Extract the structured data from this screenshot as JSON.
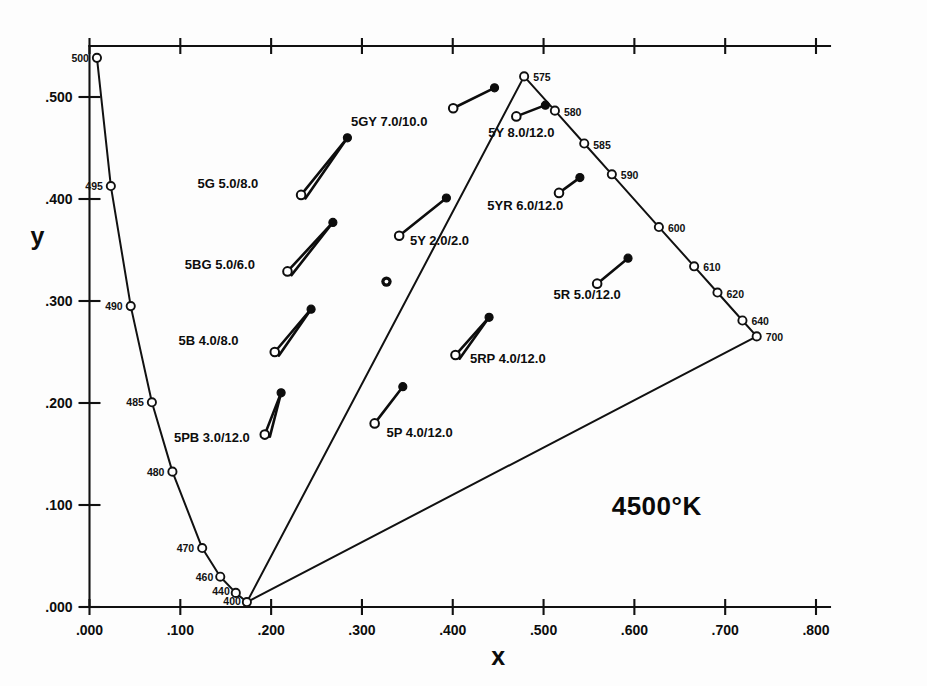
{
  "chart_data": {
    "type": "scatter",
    "title": "",
    "annotation": "4500°K",
    "xlabel": "x",
    "ylabel": "y",
    "xlim": [
      0.0,
      0.8
    ],
    "ylim": [
      0.0,
      0.55
    ],
    "grid": false,
    "legend": "none",
    "xticks": [
      ".000",
      ".100",
      ".200",
      ".300",
      ".400",
      ".500",
      ".600",
      ".700",
      ".800"
    ],
    "xtick_values": [
      0.0,
      0.1,
      0.2,
      0.3,
      0.4,
      0.5,
      0.6,
      0.7,
      0.8
    ],
    "yticks": [
      ".000",
      ".100",
      ".200",
      ".300",
      ".400",
      ".500"
    ],
    "ytick_values": [
      0.0,
      0.1,
      0.2,
      0.3,
      0.4,
      0.5
    ],
    "spectral_locus": {
      "name": "CIE spectral locus",
      "points": [
        {
          "label": "500",
          "x": 0.0082,
          "y": 0.5384
        },
        {
          "label": "495",
          "x": 0.0235,
          "y": 0.4127
        },
        {
          "label": "490",
          "x": 0.0454,
          "y": 0.295
        },
        {
          "label": "485",
          "x": 0.0687,
          "y": 0.2007
        },
        {
          "label": "480",
          "x": 0.0913,
          "y": 0.1327
        },
        {
          "label": "470",
          "x": 0.1241,
          "y": 0.0578
        },
        {
          "label": "460",
          "x": 0.144,
          "y": 0.0297
        },
        {
          "label": "440",
          "x": 0.1611,
          "y": 0.0138
        },
        {
          "label": "400",
          "x": 0.1733,
          "y": 0.0048
        },
        {
          "label": "575",
          "x": 0.4786,
          "y": 0.5202
        },
        {
          "label": "580",
          "x": 0.5125,
          "y": 0.4866
        },
        {
          "label": "585",
          "x": 0.5448,
          "y": 0.4544
        },
        {
          "label": "590",
          "x": 0.5752,
          "y": 0.4242
        },
        {
          "label": "600",
          "x": 0.627,
          "y": 0.3725
        },
        {
          "label": "610",
          "x": 0.6658,
          "y": 0.334
        },
        {
          "label": "620",
          "x": 0.6915,
          "y": 0.3083
        },
        {
          "label": "640",
          "x": 0.719,
          "y": 0.2809
        },
        {
          "label": "700",
          "x": 0.7347,
          "y": 0.2653
        }
      ]
    },
    "white_point": {
      "name": "white-point",
      "x": 0.327,
      "y": 0.319
    },
    "munsell_samples": [
      {
        "label": "5GY 7.0/10.0",
        "start": {
          "x": 0.4005,
          "y": 0.489
        },
        "end": {
          "x": 0.446,
          "y": 0.509
        },
        "double_line": false,
        "label_x": 0.288,
        "label_y": 0.472
      },
      {
        "label": "5Y 8.0/12.0",
        "start": {
          "x": 0.47,
          "y": 0.481
        },
        "end": {
          "x": 0.502,
          "y": 0.492
        },
        "double_line": false,
        "label_x": 0.439,
        "label_y": 0.461
      },
      {
        "label": "5G 5.0/8.0",
        "start": {
          "x": 0.233,
          "y": 0.404
        },
        "end": {
          "x": 0.284,
          "y": 0.46
        },
        "double_line": true,
        "label_x": 0.119,
        "label_y": 0.411
      },
      {
        "label": "5YR 6.0/12.0",
        "start": {
          "x": 0.517,
          "y": 0.406
        },
        "end": {
          "x": 0.54,
          "y": 0.421
        },
        "double_line": false,
        "label_x": 0.438,
        "label_y": 0.389
      },
      {
        "label": "5BG 5.0/6.0",
        "start": {
          "x": 0.218,
          "y": 0.329
        },
        "end": {
          "x": 0.268,
          "y": 0.377
        },
        "double_line": true,
        "label_x": 0.105,
        "label_y": 0.331
      },
      {
        "label": "5Y 2.0/2.0",
        "start": {
          "x": 0.341,
          "y": 0.364
        },
        "end": {
          "x": 0.393,
          "y": 0.401
        },
        "double_line": false,
        "label_x": 0.353,
        "label_y": 0.355
      },
      {
        "label": "5R 5.0/12.0",
        "start": {
          "x": 0.559,
          "y": 0.317
        },
        "end": {
          "x": 0.593,
          "y": 0.342
        },
        "double_line": false,
        "label_x": 0.511,
        "label_y": 0.302
      },
      {
        "label": "5B 4.0/8.0",
        "start": {
          "x": 0.204,
          "y": 0.25
        },
        "end": {
          "x": 0.244,
          "y": 0.292
        },
        "double_line": true,
        "label_x": 0.098,
        "label_y": 0.257
      },
      {
        "label": "5RP 4.0/12.0",
        "start": {
          "x": 0.403,
          "y": 0.247
        },
        "end": {
          "x": 0.44,
          "y": 0.284
        },
        "double_line": true,
        "label_x": 0.419,
        "label_y": 0.239
      },
      {
        "label": "5PB 3.0/12.0",
        "start": {
          "x": 0.193,
          "y": 0.169
        },
        "end": {
          "x": 0.211,
          "y": 0.21
        },
        "double_line": true,
        "label_x": 0.093,
        "label_y": 0.162
      },
      {
        "label": "5P 4.0/12.0",
        "start": {
          "x": 0.314,
          "y": 0.18
        },
        "end": {
          "x": 0.345,
          "y": 0.216
        },
        "double_line": false,
        "label_x": 0.327,
        "label_y": 0.167
      }
    ],
    "purple_line": {
      "name": "line-of-purples",
      "from": {
        "x": 0.1733,
        "y": 0.0048
      },
      "to": {
        "x": 0.7347,
        "y": 0.2653
      }
    }
  },
  "axes": {
    "x_title": "x",
    "y_title": "y"
  },
  "annotation": {
    "color_temperature": "4500°K"
  }
}
